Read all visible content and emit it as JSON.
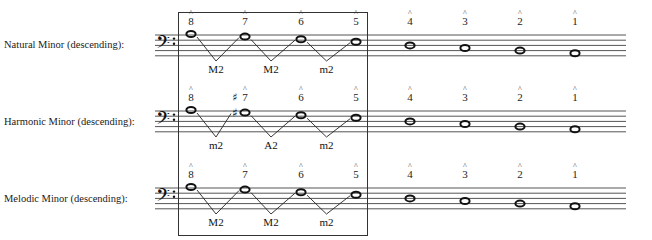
{
  "rows": [
    {
      "label": "Natural Minor (descending):",
      "staff_top": 35,
      "degrees": [
        {
          "num": "8",
          "sharp": false,
          "x": 191,
          "step": 0
        },
        {
          "num": "7",
          "sharp": false,
          "x": 245,
          "step": 1
        },
        {
          "num": "6",
          "sharp": false,
          "x": 301,
          "step": 2
        },
        {
          "num": "5",
          "sharp": false,
          "x": 356,
          "step": 3
        },
        {
          "num": "4",
          "sharp": false,
          "x": 410,
          "step": 4
        },
        {
          "num": "3",
          "sharp": false,
          "x": 465,
          "step": 5
        },
        {
          "num": "2",
          "sharp": false,
          "x": 520,
          "step": 6
        },
        {
          "num": "1",
          "sharp": false,
          "x": 575,
          "step": 7
        }
      ],
      "intervals": [
        "M2",
        "M2",
        "m2"
      ]
    },
    {
      "label": "Harmonic Minor (descending):",
      "staff_top": 111,
      "degrees": [
        {
          "num": "8",
          "sharp": false,
          "x": 191,
          "step": 0
        },
        {
          "num": "7",
          "sharp": true,
          "x": 245,
          "step": 1
        },
        {
          "num": "6",
          "sharp": false,
          "x": 301,
          "step": 2
        },
        {
          "num": "5",
          "sharp": false,
          "x": 356,
          "step": 3
        },
        {
          "num": "4",
          "sharp": false,
          "x": 410,
          "step": 4
        },
        {
          "num": "3",
          "sharp": false,
          "x": 465,
          "step": 5
        },
        {
          "num": "2",
          "sharp": false,
          "x": 520,
          "step": 6
        },
        {
          "num": "1",
          "sharp": false,
          "x": 575,
          "step": 7
        }
      ],
      "intervals": [
        "m2",
        "A2",
        "m2"
      ]
    },
    {
      "label": "Melodic Minor (descending):",
      "staff_top": 188,
      "degrees": [
        {
          "num": "8",
          "sharp": false,
          "x": 191,
          "step": 0
        },
        {
          "num": "7",
          "sharp": false,
          "x": 245,
          "step": 1
        },
        {
          "num": "6",
          "sharp": false,
          "x": 301,
          "step": 2
        },
        {
          "num": "5",
          "sharp": false,
          "x": 356,
          "step": 3
        },
        {
          "num": "4",
          "sharp": false,
          "x": 410,
          "step": 4
        },
        {
          "num": "3",
          "sharp": false,
          "x": 465,
          "step": 5
        },
        {
          "num": "2",
          "sharp": false,
          "x": 520,
          "step": 6
        },
        {
          "num": "1",
          "sharp": false,
          "x": 575,
          "step": 7
        }
      ],
      "intervals": [
        "M2",
        "M2",
        "m2"
      ]
    }
  ],
  "clef": "bass-clef",
  "scale_degree_caret": "^",
  "highlight_box": {
    "covers_degrees": [
      "8",
      "7",
      "6",
      "5"
    ]
  }
}
